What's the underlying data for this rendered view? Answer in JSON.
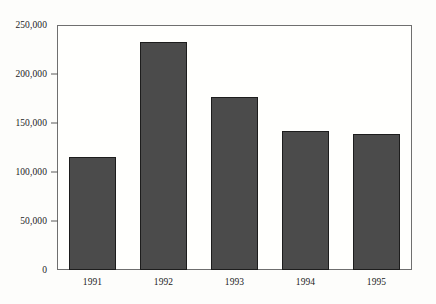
{
  "chart_data": {
    "type": "bar",
    "title": "",
    "subtitle": "",
    "xlabel": "",
    "ylabel": "",
    "categories": [
      "1991",
      "1992",
      "1993",
      "1994",
      "1995"
    ],
    "values": [
      115000,
      233000,
      177000,
      142000,
      139000
    ],
    "series": [
      {
        "name": "",
        "values": [
          115000,
          233000,
          177000,
          142000,
          139000
        ]
      }
    ],
    "ylim": [
      0,
      250000
    ],
    "ytick_values": [
      0,
      50000,
      100000,
      150000,
      200000,
      250000
    ],
    "ytick_labels": [
      "0",
      "50,000",
      "100,000",
      "150,000",
      "200,000",
      "250,000"
    ],
    "xtick_labels": [
      "1991",
      "1992",
      "1993",
      "1994",
      "1995"
    ],
    "grid": false,
    "legend": false,
    "legend_position": "none",
    "annotations": [],
    "colors": {
      "bar_fill": "#4b4b4b",
      "bar_edge": "#1d1d1d",
      "axis": "#6f6f6f",
      "tick": "#5a5a5a",
      "text": "#1b1b1b",
      "background": "#fdfdfb",
      "plot_background": "#fffffd"
    }
  }
}
